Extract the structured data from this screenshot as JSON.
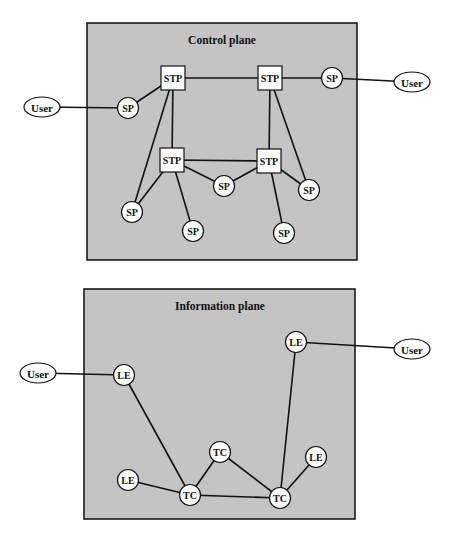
{
  "colors": {
    "plane_background": "#c4c4c4",
    "node_fill": "#ffffff",
    "line": "#111111"
  },
  "control_plane": {
    "title": "Control plane",
    "box": {
      "x": 87,
      "y": 23,
      "w": 270,
      "h": 237
    },
    "nodes": [
      {
        "id": "stp1",
        "type": "STP",
        "label": "STP",
        "shape": "square",
        "x": 173,
        "y": 78
      },
      {
        "id": "stp2",
        "type": "STP",
        "label": "STP",
        "shape": "square",
        "x": 270,
        "y": 78
      },
      {
        "id": "stp3",
        "type": "STP",
        "label": "STP",
        "shape": "square",
        "x": 172,
        "y": 160
      },
      {
        "id": "stp4",
        "type": "STP",
        "label": "STP",
        "shape": "square",
        "x": 269,
        "y": 161
      },
      {
        "id": "sp1",
        "type": "SP",
        "label": "SP",
        "shape": "circle",
        "x": 128,
        "y": 108
      },
      {
        "id": "sp2",
        "type": "SP",
        "label": "SP",
        "shape": "circle",
        "x": 332,
        "y": 78
      },
      {
        "id": "sp3",
        "type": "SP",
        "label": "SP",
        "shape": "circle",
        "x": 132,
        "y": 212
      },
      {
        "id": "sp4",
        "type": "SP",
        "label": "SP",
        "shape": "circle",
        "x": 224,
        "y": 186
      },
      {
        "id": "sp5",
        "type": "SP",
        "label": "SP",
        "shape": "circle",
        "x": 309,
        "y": 190
      },
      {
        "id": "sp6",
        "type": "SP",
        "label": "SP",
        "shape": "circle",
        "x": 193,
        "y": 231
      },
      {
        "id": "sp7",
        "type": "SP",
        "label": "SP",
        "shape": "circle",
        "x": 284,
        "y": 233
      },
      {
        "id": "user1",
        "type": "User",
        "label": "User",
        "shape": "ellipse",
        "x": 42,
        "y": 107
      },
      {
        "id": "user2",
        "type": "User",
        "label": "User",
        "shape": "ellipse",
        "x": 412,
        "y": 82
      }
    ],
    "edges": [
      [
        "user1",
        "sp1"
      ],
      [
        "sp1",
        "stp1"
      ],
      [
        "stp1",
        "stp2"
      ],
      [
        "stp2",
        "sp2"
      ],
      [
        "sp2",
        "user2"
      ],
      [
        "stp1",
        "stp3"
      ],
      [
        "stp1",
        "sp3"
      ],
      [
        "stp3",
        "sp3"
      ],
      [
        "stp3",
        "sp6"
      ],
      [
        "stp3",
        "stp4"
      ],
      [
        "stp3",
        "sp4"
      ],
      [
        "sp4",
        "stp4"
      ],
      [
        "stp2",
        "stp4"
      ],
      [
        "stp2",
        "sp5"
      ],
      [
        "stp4",
        "sp5"
      ],
      [
        "stp4",
        "sp7"
      ]
    ]
  },
  "information_plane": {
    "title": "Information plane",
    "box": {
      "x": 84,
      "y": 289,
      "w": 271,
      "h": 230
    },
    "nodes": [
      {
        "id": "le1",
        "type": "LE",
        "label": "LE",
        "shape": "circle",
        "x": 124,
        "y": 375
      },
      {
        "id": "le2",
        "type": "LE",
        "label": "LE",
        "shape": "circle",
        "x": 296,
        "y": 342
      },
      {
        "id": "le3",
        "type": "LE",
        "label": "LE",
        "shape": "circle",
        "x": 128,
        "y": 480
      },
      {
        "id": "le4",
        "type": "LE",
        "label": "LE",
        "shape": "circle",
        "x": 316,
        "y": 457
      },
      {
        "id": "tc1",
        "type": "TC",
        "label": "TC",
        "shape": "circle",
        "x": 220,
        "y": 452
      },
      {
        "id": "tc2",
        "type": "TC",
        "label": "TC",
        "shape": "circle",
        "x": 190,
        "y": 495
      },
      {
        "id": "tc3",
        "type": "TC",
        "label": "TC",
        "shape": "circle",
        "x": 280,
        "y": 498
      },
      {
        "id": "user3",
        "type": "User",
        "label": "User",
        "shape": "ellipse",
        "x": 38,
        "y": 373
      },
      {
        "id": "user4",
        "type": "User",
        "label": "User",
        "shape": "ellipse",
        "x": 412,
        "y": 349
      }
    ],
    "edges": [
      [
        "user3",
        "le1"
      ],
      [
        "le1",
        "tc2"
      ],
      [
        "le3",
        "tc2"
      ],
      [
        "tc2",
        "tc1"
      ],
      [
        "tc2",
        "tc3"
      ],
      [
        "tc1",
        "tc3"
      ],
      [
        "tc3",
        "le4"
      ],
      [
        "tc3",
        "le2"
      ],
      [
        "le2",
        "user4"
      ]
    ]
  }
}
